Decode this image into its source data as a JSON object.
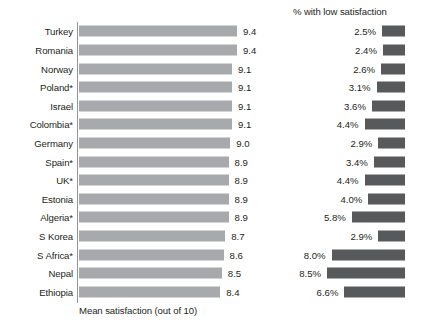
{
  "left_panel": {
    "axis_caption": "Mean satisfaction (out of 10)"
  },
  "right_panel": {
    "title": "% with low satisfaction"
  },
  "chart_data": {
    "type": "bar",
    "title": "",
    "orientation": "horizontal",
    "categories": [
      "Turkey",
      "Romania",
      "Norway",
      "Poland*",
      "Israel",
      "Colombia*",
      "Germany",
      "Spain*",
      "UK*",
      "Estonia",
      "Algeria*",
      "S Korea",
      "S Africa*",
      "Nepal",
      "Ethiopia"
    ],
    "series": [
      {
        "name": "Mean satisfaction (out of 10)",
        "panel": "left",
        "color": "#a7a9ac",
        "value_labels": [
          "9.4",
          "9.4",
          "9.1",
          "9.1",
          "9.1",
          "9.1",
          "9.0",
          "8.9",
          "8.9",
          "8.9",
          "8.9",
          "8.7",
          "8.6",
          "8.5",
          "8.4"
        ],
        "values": [
          9.4,
          9.4,
          9.1,
          9.1,
          9.1,
          9.1,
          9.0,
          8.9,
          8.9,
          8.9,
          8.9,
          8.7,
          8.6,
          8.5,
          8.4
        ],
        "xlim": [
          0,
          10
        ]
      },
      {
        "name": "% with low satisfaction",
        "panel": "right",
        "color": "#58595b",
        "value_labels": [
          "2.5%",
          "2.4%",
          "2.6%",
          "3.1%",
          "3.6%",
          "4.4%",
          "2.9%",
          "3.4%",
          "4.4%",
          "4.0%",
          "5.8%",
          "2.9%",
          "8.0%",
          "8.5%",
          "6.6%"
        ],
        "values": [
          2.5,
          2.4,
          2.6,
          3.1,
          3.6,
          4.4,
          2.9,
          3.4,
          4.4,
          4.0,
          5.8,
          2.9,
          8.0,
          8.5,
          6.6
        ],
        "xlim": [
          0,
          8.5
        ]
      }
    ],
    "xlabel": "Mean satisfaction (out of 10)",
    "ylabel": "",
    "grid": false,
    "legend": false,
    "footnote_marker": "*"
  }
}
